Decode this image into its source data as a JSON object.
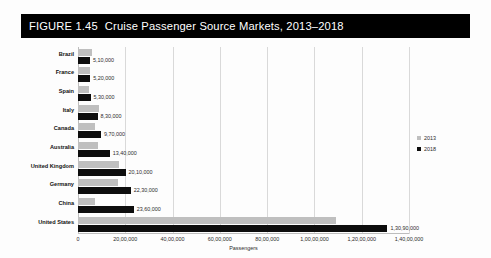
{
  "figure": {
    "number": "FIGURE 1.45",
    "title": "Cruise Passenger Source Markets, 2013–2018",
    "banner_color": "#000000",
    "banner_text_color": "#ffffff"
  },
  "chart_data": {
    "type": "bar",
    "orientation": "horizontal",
    "title": "Cruise Passenger Source Markets, 2013–2018",
    "xlabel": "Passengers",
    "ylabel": "",
    "xlim": [
      0,
      14000000
    ],
    "grid": true,
    "legend_position": "right",
    "categories": [
      "Brazil",
      "France",
      "Spain",
      "Italy",
      "Canada",
      "Australia",
      "United Kingdom",
      "Germany",
      "China",
      "United States"
    ],
    "series": [
      {
        "name": "2013",
        "color": "#bfbfbf",
        "values": [
          610000,
          522000,
          475000,
          869000,
          716000,
          833000,
          1726000,
          1687000,
          703000,
          10900000
        ],
        "labels": [
          "",
          "",
          "",
          "",
          "",
          "",
          "",
          "",
          "",
          ""
        ]
      },
      {
        "name": "2018",
        "color": "#0d0d0d",
        "values": [
          510000,
          520000,
          530000,
          830000,
          970000,
          1340000,
          2010000,
          2230000,
          2360000,
          13090000
        ],
        "labels": [
          "5,10,000",
          "5,20,000",
          "5,30,000",
          "8,30,000",
          "9,70,000",
          "13,40,000",
          "20,10,000",
          "22,30,000",
          "23,60,000",
          "1,30,90,000"
        ]
      }
    ],
    "xticks": [
      0,
      2000000,
      4000000,
      6000000,
      8000000,
      10000000,
      12000000,
      14000000
    ],
    "xtick_labels": [
      "0",
      "20,00,000",
      "40,00,000",
      "60,00,000",
      "80,00,000",
      "1,00,00,000",
      "1,20,00,000",
      "1,40,00,000"
    ],
    "legend": [
      {
        "label": "2013",
        "color": "#bfbfbf"
      },
      {
        "label": "2018",
        "color": "#0d0d0d"
      }
    ]
  }
}
